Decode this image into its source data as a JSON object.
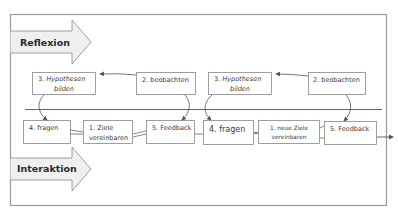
{
  "lanes": {
    "top": "Reflexion",
    "bottom": "Interaktion"
  },
  "cycle1": {
    "hypothesen": [
      "3. ",
      "Hypothesen",
      "bilden"
    ],
    "beobachten": "2. beobachten",
    "fragen": "4. fragen",
    "ziele": [
      "1. Ziele",
      "vereinbaren"
    ],
    "feedback": "5. Feedback"
  },
  "cycle2": {
    "hypothesen": [
      "3. ",
      "Hypothesen",
      "bilden"
    ],
    "beobachten": "2. beobachten",
    "fragen": "4.  fragen",
    "ziele": [
      "1. neue Ziele",
      "vereinbaren"
    ],
    "feedback": "5. Feedback"
  }
}
